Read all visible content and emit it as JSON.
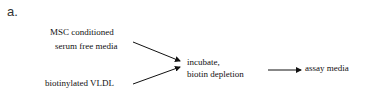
{
  "panel_label": "a.",
  "nodes": {
    "input1": [
      "MSC conditioned",
      "serum free media"
    ],
    "input2": "biotinylated VLDL",
    "process": [
      "incubate,",
      "biotin depletion"
    ],
    "output": "assay media"
  },
  "edges": [
    {
      "from": "input1",
      "to": "process"
    },
    {
      "from": "input2",
      "to": "process"
    },
    {
      "from": "process",
      "to": "output"
    }
  ]
}
